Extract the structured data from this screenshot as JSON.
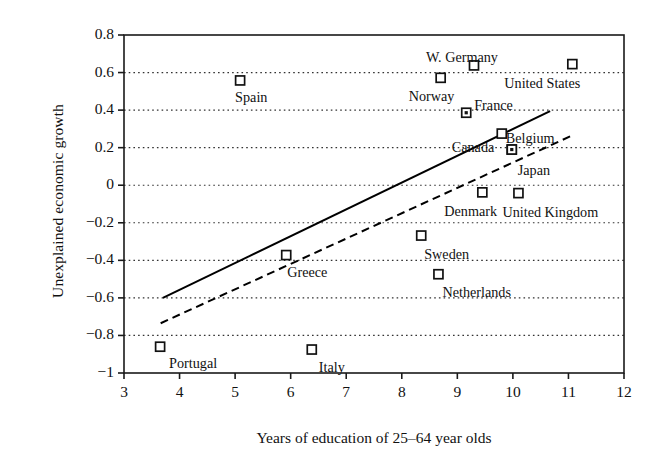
{
  "chart_data": {
    "type": "scatter",
    "title": "",
    "xlabel": "Years of education of 25–64 year olds",
    "ylabel": "Unexplained economic growth",
    "xlim": [
      3,
      12
    ],
    "ylim": [
      -1,
      0.8
    ],
    "xticks": [
      "3",
      "4",
      "5",
      "6",
      "7",
      "8",
      "9",
      "10",
      "11",
      "12"
    ],
    "xtick_values": [
      3,
      4,
      5,
      6,
      7,
      8,
      9,
      10,
      11,
      12
    ],
    "yticks": [
      "0.8",
      "0.6",
      "0.4",
      "0.2",
      "0",
      "−0.2",
      "−0.4",
      "−0.6",
      "−0.8",
      "−1"
    ],
    "ytick_values": [
      0.8,
      0.6,
      0.4,
      0.2,
      0,
      -0.2,
      -0.4,
      -0.6,
      -0.8,
      -1
    ],
    "grid": "horizontal-dotted",
    "legend": "none",
    "marker": "open-square",
    "points": [
      {
        "label": "Portugal",
        "x": 3.65,
        "y": -0.86,
        "label_dx": 9,
        "label_dy": 9
      },
      {
        "label": "Spain",
        "x": 5.09,
        "y": 0.558,
        "label_dx": -5,
        "label_dy": 10
      },
      {
        "label": "Greece",
        "x": 5.92,
        "y": -0.372,
        "label_dx": 1,
        "label_dy": 10
      },
      {
        "label": "Italy",
        "x": 6.38,
        "y": -0.875,
        "label_dx": 7,
        "label_dy": 10
      },
      {
        "label": "Sweden",
        "x": 8.35,
        "y": -0.268,
        "label_dx": 3,
        "label_dy": 11
      },
      {
        "label": "Norway",
        "x": 8.7,
        "y": 0.572,
        "label_dx": -32,
        "label_dy": 11
      },
      {
        "label": "Netherlands",
        "x": 8.66,
        "y": -0.474,
        "label_dx": 4,
        "label_dy": 11
      },
      {
        "label": "France",
        "x": 9.16,
        "y": 0.386,
        "label_dx": 8,
        "label_dy": -15
      },
      {
        "label": "W. Germany",
        "x": 9.3,
        "y": 0.638,
        "label_dx": -48,
        "label_dy": -15
      },
      {
        "label": "Belgium",
        "x": 9.8,
        "y": 0.275,
        "label_dx": 4,
        "label_dy": -3
      },
      {
        "label": "Denmark",
        "x": 9.45,
        "y": -0.038,
        "label_dx": -38,
        "label_dy": 12
      },
      {
        "label": "Canada",
        "x": 9.98,
        "y": 0.19,
        "label_dx": -60,
        "label_dy": -10
      },
      {
        "label": "Japan",
        "x": 9.98,
        "y": 0.19,
        "label_dx": 6,
        "label_dy": 13
      },
      {
        "label": "United Kingdom",
        "x": 10.1,
        "y": -0.042,
        "label_dx": -16,
        "label_dy": 12
      },
      {
        "label": "United States",
        "x": 11.07,
        "y": 0.645,
        "label_dx": -68,
        "label_dy": 12
      }
    ],
    "trend_lines": [
      {
        "name": "solid-fit",
        "style": "solid",
        "x0": 3.7,
        "y0": -0.6,
        "x1": 10.67,
        "y1": 0.395
      },
      {
        "name": "dashed-fit",
        "style": "dashed",
        "x0": 3.66,
        "y0": -0.735,
        "x1": 11.09,
        "y1": 0.268
      }
    ],
    "colors": {
      "axis": "#1a1a1a",
      "grid": "#333333",
      "marker": "#111111",
      "line": "#000000"
    }
  }
}
